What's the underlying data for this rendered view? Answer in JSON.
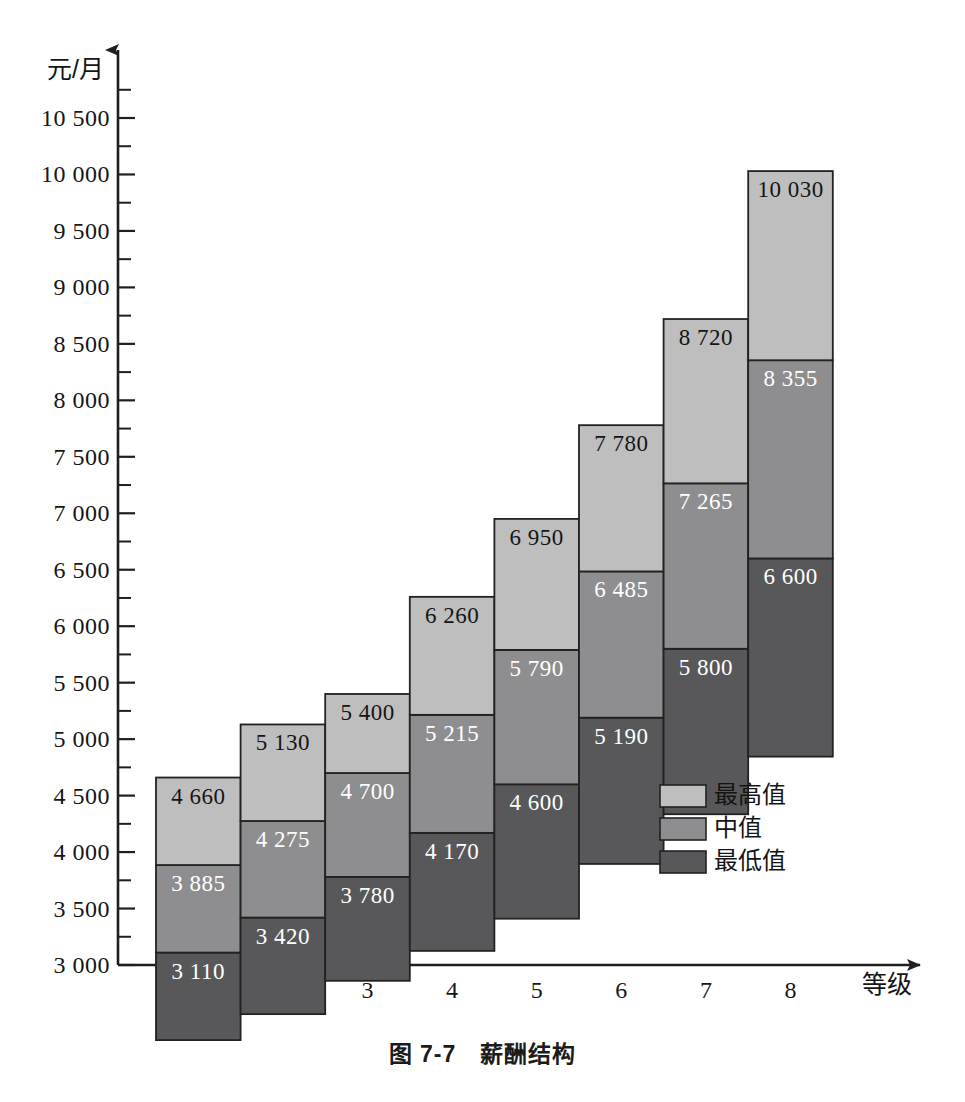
{
  "figure": {
    "caption": "图 7-7　薪酬结构",
    "caption_top": 1035
  },
  "chart_data": {
    "type": "bar",
    "subtype": "floating-stacked-range-bar",
    "xlabel": "等级",
    "ylabel": "元/月",
    "categories": [
      "1",
      "2",
      "3",
      "4",
      "5",
      "6",
      "7",
      "8"
    ],
    "ylim": [
      3000,
      10500
    ],
    "ytick_step": 500,
    "yminor_step": 250,
    "grid": false,
    "legend_position": "inside-right",
    "ytick_labels": [
      "3 000",
      "3 500",
      "4 000",
      "4 500",
      "5 000",
      "5 500",
      "6 000",
      "6 500",
      "7 000",
      "7 500",
      "8 000",
      "8 500",
      "9 000",
      "9 500",
      "10 000",
      "10 500"
    ],
    "ytick_values": [
      3000,
      3500,
      4000,
      4500,
      5000,
      5500,
      6000,
      6500,
      7000,
      7500,
      8000,
      8500,
      9000,
      9500,
      10000,
      10500
    ],
    "series": [
      {
        "name": "最低值",
        "key": "min",
        "color": "#58585a",
        "values": [
          3110,
          3420,
          3780,
          4170,
          4600,
          5190,
          5800,
          6600
        ],
        "labels": [
          "3 110",
          "3 420",
          "3 780",
          "4 170",
          "4 600",
          "5 190",
          "5 800",
          "6 600"
        ]
      },
      {
        "name": "中值",
        "key": "mid",
        "color": "#8e8e90",
        "values": [
          3885,
          4275,
          4700,
          5215,
          5790,
          6485,
          7265,
          8355
        ],
        "labels": [
          "3 885",
          "4 275",
          "4 700",
          "5 215",
          "5 790",
          "6 485",
          "7 265",
          "8 355"
        ]
      },
      {
        "name": "最高值",
        "key": "max",
        "color": "#bebebe",
        "values": [
          4660,
          5130,
          5400,
          6260,
          6950,
          7780,
          8720,
          10030
        ],
        "labels": [
          "4 660",
          "5 130",
          "5 400",
          "6 260",
          "6 950",
          "7 780",
          "8 720",
          "10 030"
        ]
      }
    ],
    "bar_bottoms": [
      3110,
      3420,
      3780,
      4170,
      4600,
      5190,
      5800,
      6600
    ],
    "legend": [
      {
        "label": "最高值",
        "color": "#bebebe"
      },
      {
        "label": "中值",
        "color": "#8e8e90"
      },
      {
        "label": "最低值",
        "color": "#58585a"
      }
    ],
    "colors": {
      "highest": "#bebebe",
      "median": "#8e8e90",
      "lowest": "#58585a",
      "axis": "#1f1f1f",
      "label_on_light": "#151515",
      "label_on_dark": "#ffffff"
    }
  }
}
